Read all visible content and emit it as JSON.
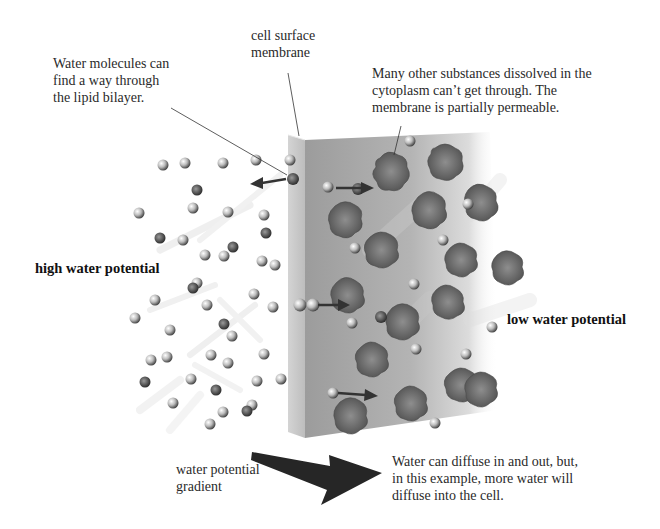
{
  "diagram": {
    "title_concept": "Osmosis across a cell surface membrane",
    "labels": {
      "water_molecules": [
        "Water molecules can",
        "find a way through",
        "the lipid bilayer."
      ],
      "membrane": [
        "cell surface",
        "membrane"
      ],
      "other_substances": [
        "Many other substances dissolved in the",
        "cytoplasm can’t get through. The",
        "membrane is partially permeable."
      ],
      "high_potential": "high water potential",
      "low_potential": "low water potential",
      "gradient": [
        "water potential",
        "gradient"
      ],
      "diffusion_note": [
        "Water can diffuse in and out, but,",
        "in this example, more water will",
        "diffuse into the cell."
      ]
    },
    "regions": {
      "outside": "high water potential",
      "inside_cytoplasm": "low water potential"
    },
    "colors": {
      "background": "#ffffff",
      "membrane_face": "#c9c9c9",
      "cytoplasm_panel": "#a9a9a9",
      "solute_blob": "#6a6a6a",
      "arrow": "#2b2b2b",
      "text": "#222222"
    }
  }
}
